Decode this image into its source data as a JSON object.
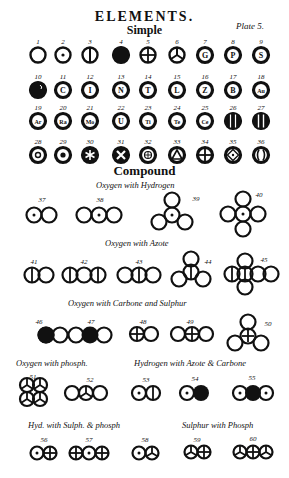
{
  "header": {
    "title": "ELEMENTS.",
    "subtitle": "Simple",
    "plate": "Plate 5."
  },
  "simple": {
    "rows": [
      [
        {
          "n": "1",
          "sym": "empty"
        },
        {
          "n": "2",
          "sym": "dot"
        },
        {
          "n": "3",
          "sym": "vbar"
        },
        {
          "n": "4",
          "sym": "solid"
        },
        {
          "n": "5",
          "sym": "cross"
        },
        {
          "n": "6",
          "sym": "tri-spoke"
        },
        {
          "n": "7",
          "sym": "letter",
          "letter": "G"
        },
        {
          "n": "8",
          "sym": "letter",
          "letter": "P"
        },
        {
          "n": "9",
          "sym": "letter",
          "letter": "S"
        }
      ],
      [
        {
          "n": "10",
          "sym": "blob"
        },
        {
          "n": "11",
          "sym": "letter",
          "letter": "C"
        },
        {
          "n": "12",
          "sym": "letter",
          "letter": "I"
        },
        {
          "n": "13",
          "sym": "letter",
          "letter": "N"
        },
        {
          "n": "14",
          "sym": "letter",
          "letter": "T"
        },
        {
          "n": "15",
          "sym": "letter",
          "letter": "L"
        },
        {
          "n": "16",
          "sym": "letter",
          "letter": "Z"
        },
        {
          "n": "17",
          "sym": "letter",
          "letter": "B"
        },
        {
          "n": "18",
          "sym": "letter",
          "letter": "Au"
        }
      ],
      [
        {
          "n": "19",
          "sym": "letter",
          "letter": "Ar"
        },
        {
          "n": "20",
          "sym": "letter",
          "letter": "Ra"
        },
        {
          "n": "21",
          "sym": "letter",
          "letter": "Mo"
        },
        {
          "n": "22",
          "sym": "letter",
          "letter": "U"
        },
        {
          "n": "23",
          "sym": "letter",
          "letter": "Ti"
        },
        {
          "n": "24",
          "sym": "letter",
          "letter": "Te"
        },
        {
          "n": "25",
          "sym": "letter",
          "letter": "Ce"
        },
        {
          "n": "26",
          "sym": "bars2"
        },
        {
          "n": "27",
          "sym": "bars1"
        }
      ],
      [
        {
          "n": "28",
          "sym": "ring"
        },
        {
          "n": "29",
          "sym": "star-dot"
        },
        {
          "n": "30",
          "sym": "asterisk"
        },
        {
          "n": "31",
          "sym": "x-spoke"
        },
        {
          "n": "32",
          "sym": "flower"
        },
        {
          "n": "33",
          "sym": "triangle"
        },
        {
          "n": "34",
          "sym": "cross"
        },
        {
          "n": "35",
          "sym": "diamond"
        },
        {
          "n": "36",
          "sym": "brackets"
        }
      ]
    ]
  },
  "compound": {
    "title": "Compound",
    "sections": [
      {
        "caption": "Oxygen  with Hydrogen"
      },
      {
        "caption": "Oxygen  with Azote"
      },
      {
        "caption": "Oxygen with Carbone  and Sulphur"
      },
      {
        "caption": "Oxygen with phosph."
      },
      {
        "caption": "Hydrogen with Azote & Carbone"
      },
      {
        "caption": "Hyd. with Sulph. & phosph"
      },
      {
        "caption": "Sulphur with Phosph"
      }
    ],
    "numbers": [
      "37",
      "38",
      "39",
      "40",
      "41",
      "42",
      "43",
      "44",
      "45",
      "46",
      "47",
      "48",
      "49",
      "50",
      "51",
      "52",
      "53",
      "54",
      "55",
      "56",
      "57",
      "58",
      "59",
      "60"
    ]
  }
}
